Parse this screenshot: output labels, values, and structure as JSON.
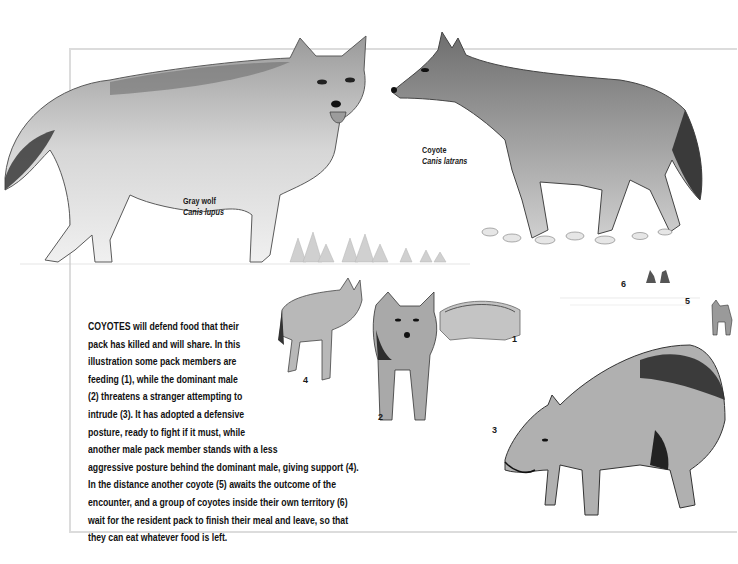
{
  "figure": {
    "species_labels": [
      {
        "common_name": "Gray wolf",
        "scientific_name": "Canis lupus"
      },
      {
        "common_name": "Coyote",
        "scientific_name": "Canis latrans"
      }
    ],
    "scene_numbers": [
      "1",
      "2",
      "3",
      "4",
      "5",
      "6"
    ],
    "caption": {
      "lead_word": "COYOTES",
      "lines": [
        " will defend food that their",
        "pack has killed and will share. In this",
        "illustration some pack members are",
        "feeding (1), while the dominant male",
        "(2) threatens a stranger attempting to",
        "intrude (3). It has adopted a defensive",
        "posture, ready to fight if it must, while",
        "another male pack member stands with a less",
        "aggressive posture behind the dominant male, giving support (4).",
        "In the distance another coyote (5) awaits the outcome of the",
        "encounter, and a group of coyotes inside their own territory (6)",
        "wait for the resident pack to finish their meal and leave, so that",
        "they can eat whatever food is left."
      ]
    },
    "illustrations": [
      "gray-wolf-standing",
      "coyote-standing",
      "feeding-coyotes",
      "dominant-male-coyote",
      "intruding-coyote-defensive",
      "supporting-male-coyote",
      "distant-coyote",
      "waiting-coyote-group",
      "treeline"
    ],
    "colors": {
      "ink": "#1a1a1a",
      "frame": "#dcdcdc",
      "fur_light": "#bdbdbd",
      "fur_mid": "#8a8a8a",
      "fur_dark": "#4a4a4a"
    }
  }
}
